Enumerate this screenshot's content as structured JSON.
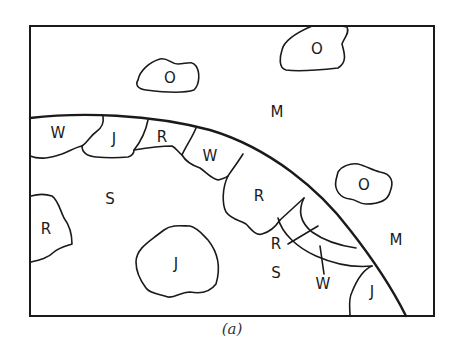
{
  "figure": {
    "caption": "(a)",
    "regions": {
      "mantle": "M",
      "surface_label": "S",
      "o_top_left": "O",
      "o_top_right": "O",
      "o_right": "O",
      "w_band_1": "W",
      "j_band_1": "J",
      "r_band_1": "R",
      "w_band_2": "W",
      "r_band_2": "R",
      "m_right": "M",
      "r_left": "R",
      "j_bottom": "J",
      "s_bottom": "S",
      "r_wedge": "R",
      "w_wedge": "W",
      "j_corner": "J"
    },
    "colors": {
      "line": "#1a1a1a",
      "background": "#ffffff"
    }
  }
}
